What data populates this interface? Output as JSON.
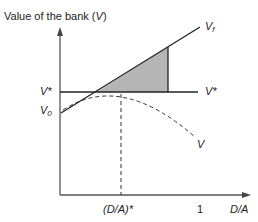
{
  "diagram": {
    "y_axis_label_prefix": "Value of the bank (",
    "y_axis_label_var": "V",
    "y_axis_label_suffix": ")",
    "x_axis_label": "D/A",
    "x_tick_star": "(D/A)*",
    "x_tick_one": "1",
    "v_star_left": "V*",
    "v_star_right": "V*",
    "v_zero": "V",
    "v_zero_sub": "0",
    "v_f": "V",
    "v_f_sub": "f",
    "v_curve": "V",
    "colors": {
      "line": "#222222",
      "shade": "#b5b5b5",
      "axis": "#555555"
    }
  }
}
